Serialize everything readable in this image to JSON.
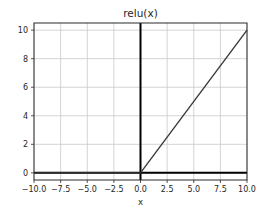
{
  "chart_data": {
    "type": "line",
    "title": "relu(x)",
    "xlabel": "x",
    "ylabel": "",
    "series": [
      {
        "name": "relu",
        "points": [
          [
            -10,
            0
          ],
          [
            0,
            0
          ],
          [
            10,
            10
          ]
        ],
        "color": "#3a3a3a",
        "linewidth": 1.4
      }
    ],
    "axis_lines": {
      "axhline_y": 0,
      "axvline_x": 0,
      "color": "#000000",
      "linewidth": 2
    },
    "xlim": [
      -10,
      10
    ],
    "ylim": [
      -0.5,
      10.5
    ],
    "xticks": [
      -10,
      -7.5,
      -5,
      -2.5,
      0,
      2.5,
      5,
      7.5,
      10
    ],
    "xtick_labels": [
      "−10.0",
      "−7.5",
      "−5.0",
      "−2.5",
      "0.0",
      "2.5",
      "5.0",
      "7.5",
      "10.0"
    ],
    "yticks": [
      0,
      2,
      4,
      6,
      8,
      10
    ],
    "ytick_labels": [
      "0",
      "2",
      "4",
      "6",
      "8",
      "10"
    ],
    "grid": true,
    "legend": "none",
    "colors": {
      "background": "#ffffff",
      "grid": "#c9c9c9",
      "spine": "#2b2b2b",
      "tick_text": "#262626"
    }
  }
}
